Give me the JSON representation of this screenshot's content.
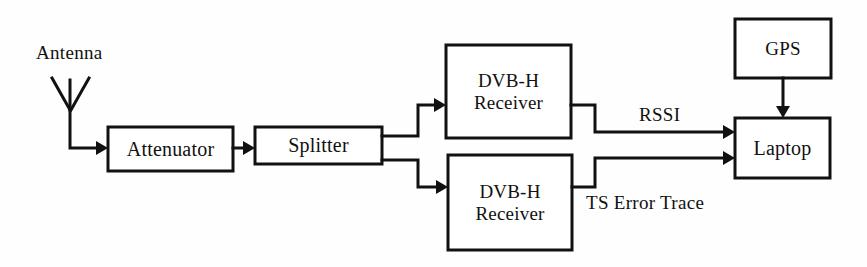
{
  "diagram": {
    "background_color": "#fefefe",
    "line_color": "#111111",
    "text_color": "#111111",
    "nodes": {
      "antenna": {
        "label": "Antenna",
        "x": 36,
        "y": 42,
        "font_size": 19
      },
      "attenuator": {
        "label": "Attenuator",
        "x": 108,
        "y": 127,
        "w": 125,
        "h": 44,
        "font_size": 20
      },
      "splitter": {
        "label": "Splitter",
        "x": 255,
        "y": 127,
        "w": 127,
        "h": 37,
        "font_size": 20
      },
      "receiver_top": {
        "label_line1": "DVB-H",
        "label_line2": "Receiver",
        "x": 446,
        "y": 45,
        "w": 125,
        "h": 93,
        "font_size": 19
      },
      "receiver_bottom": {
        "label_line1": "DVB-H",
        "label_line2": "Receiver",
        "x": 448,
        "y": 155,
        "w": 124,
        "h": 95,
        "font_size": 19
      },
      "gps": {
        "label": "GPS",
        "x": 735,
        "y": 19,
        "w": 96,
        "h": 59,
        "font_size": 19
      },
      "laptop": {
        "label": "Laptop",
        "x": 735,
        "y": 118,
        "w": 95,
        "h": 60,
        "font_size": 20
      }
    },
    "edge_labels": {
      "rssi": {
        "label": "RSSI",
        "x": 639,
        "y": 104,
        "font_size": 19
      },
      "ts_error_trace": {
        "label": "TS Error Trace",
        "x": 586,
        "y": 192,
        "font_size": 19
      }
    },
    "connections": [
      {
        "name": "antenna-to-attenuator",
        "from": "antenna",
        "to": "attenuator"
      },
      {
        "name": "attenuator-to-splitter",
        "from": "attenuator",
        "to": "splitter"
      },
      {
        "name": "splitter-to-receiver-top",
        "from": "splitter",
        "to": "receiver_top"
      },
      {
        "name": "splitter-to-receiver-bottom",
        "from": "splitter",
        "to": "receiver_bottom"
      },
      {
        "name": "receiver-top-to-laptop",
        "from": "receiver_top",
        "to": "laptop",
        "label": "RSSI"
      },
      {
        "name": "receiver-bottom-to-laptop",
        "from": "receiver_bottom",
        "to": "laptop",
        "label": "TS Error Trace"
      },
      {
        "name": "gps-to-laptop",
        "from": "gps",
        "to": "laptop"
      }
    ]
  }
}
